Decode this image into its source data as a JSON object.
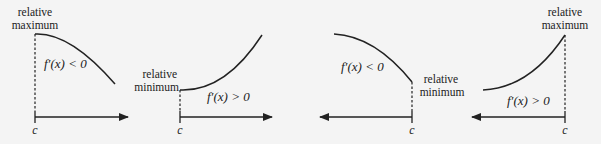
{
  "diagram": {
    "panels": [
      {
        "id": "panel-1",
        "label_line1": "relative",
        "label_line2": "maximum",
        "derivative": "f′(x) < 0",
        "point": "c",
        "arrow_direction": "right"
      },
      {
        "id": "panel-2",
        "label_line1": "relative",
        "label_line2": "minimum",
        "derivative": "f′(x) > 0",
        "point": "c",
        "arrow_direction": "right"
      },
      {
        "id": "panel-3",
        "label_line1": "relative",
        "label_line2": "minimum",
        "derivative": "f′(x) < 0",
        "point": "c",
        "arrow_direction": "left"
      },
      {
        "id": "panel-4",
        "label_line1": "relative",
        "label_line2": "maximum",
        "derivative": "f′(x) > 0",
        "point": "c",
        "arrow_direction": "left"
      }
    ],
    "colors": {
      "background": "#f4f4f4",
      "ink": "#222222"
    }
  }
}
